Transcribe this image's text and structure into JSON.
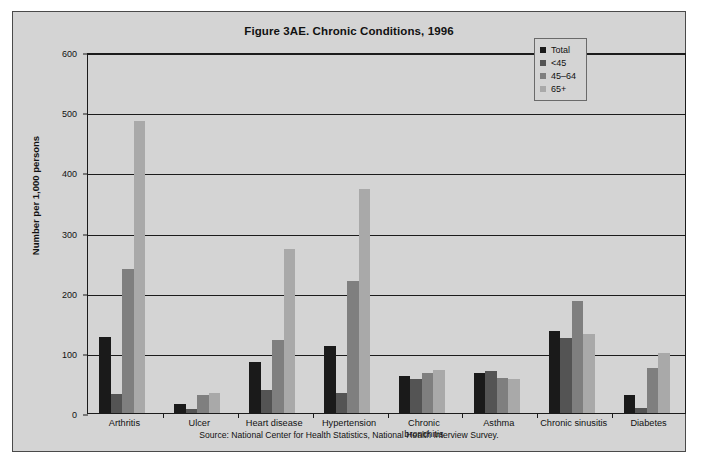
{
  "figure": {
    "title": "Figure 3AE. Chronic Conditions, 1996",
    "source_note": "Source: National Center for Health Statistics, National Health Interview Survey."
  },
  "legend": {
    "position": "top-right",
    "items": [
      {
        "label": "Total",
        "color": "#1a1a1a"
      },
      {
        "label": "<45",
        "color": "#545454"
      },
      {
        "label": "45–64",
        "color": "#7f7f7f"
      },
      {
        "label": "65+",
        "color": "#a9a9a9"
      }
    ]
  },
  "axes": {
    "ylabel": "Number per 1,000 persons",
    "xlabel": "",
    "yticks": [
      "0",
      "100",
      "200",
      "300",
      "400",
      "500",
      "600"
    ]
  },
  "chart_data": {
    "type": "bar",
    "title": "Figure 3AE. Chronic Conditions, 1996",
    "xlabel": "",
    "ylabel": "Number per 1,000 persons",
    "ylim": [
      0,
      600
    ],
    "ytick_step": 100,
    "grid": true,
    "legend_position": "top-right",
    "annotations": [
      "Source: National Center for Health Statistics, National Health Interview Survey."
    ],
    "categories": [
      "Arthritis",
      "Ulcer",
      "Heart disease",
      "Hypertension",
      "Chronic bronchitis",
      "Asthma",
      "Chronic sinusitis",
      "Diabetes"
    ],
    "series": [
      {
        "name": "Total",
        "color": "#1a1a1a",
        "values": [
          127,
          15,
          84,
          112,
          62,
          67,
          137,
          30
        ]
      },
      {
        "name": "<45",
        "color": "#545454",
        "values": [
          32,
          6,
          38,
          34,
          57,
          70,
          124,
          8
        ]
      },
      {
        "name": "45–64",
        "color": "#7f7f7f",
        "values": [
          240,
          30,
          122,
          220,
          67,
          58,
          186,
          74
        ]
      },
      {
        "name": "65+",
        "color": "#a9a9a9",
        "values": [
          485,
          33,
          273,
          372,
          72,
          56,
          131,
          99
        ]
      }
    ]
  }
}
